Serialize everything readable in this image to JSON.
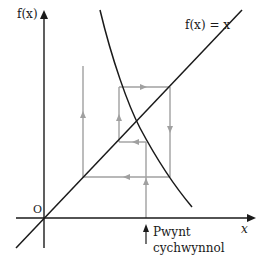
{
  "diagram": {
    "type": "cobweb",
    "y_axis_label": "f(x)",
    "x_axis_label": "x",
    "origin_label": "O",
    "line_label": "f(x) = x",
    "start_label_line1": "Pwynt",
    "start_label_line2": "cychwynnol",
    "colors": {
      "axes": "#1a1a1a",
      "curve": "#1a1a1a",
      "cobweb": "#a0a0a0"
    }
  }
}
